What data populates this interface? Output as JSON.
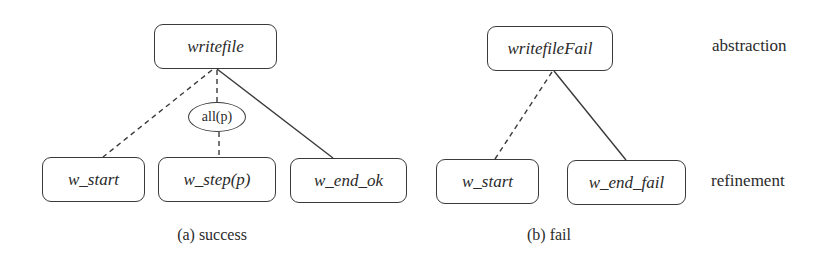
{
  "diagram": {
    "panel_a": {
      "caption": "(a) success",
      "root": "writefile",
      "quantifier": "all(p)",
      "children": [
        "w_start",
        "w_step(p)",
        "w_end_ok"
      ],
      "edges": [
        {
          "from": "writefile",
          "to": "w_start",
          "style": "dashed"
        },
        {
          "from": "writefile",
          "to": "all(p)",
          "style": "dashed"
        },
        {
          "from": "all(p)",
          "to": "w_step(p)",
          "style": "dashed"
        },
        {
          "from": "writefile",
          "to": "w_end_ok",
          "style": "solid"
        }
      ]
    },
    "panel_b": {
      "caption": "(b) fail",
      "root": "writefileFail",
      "children": [
        "w_start",
        "w_end_fail"
      ],
      "edges": [
        {
          "from": "writefileFail",
          "to": "w_start",
          "style": "dashed"
        },
        {
          "from": "writefileFail",
          "to": "w_end_fail",
          "style": "solid"
        }
      ]
    },
    "levels": {
      "top": "abstraction",
      "bottom": "refinement"
    },
    "colors": {
      "stroke": "#3a3a3a",
      "text": "#2b2b2b",
      "background": "#ffffff"
    }
  }
}
